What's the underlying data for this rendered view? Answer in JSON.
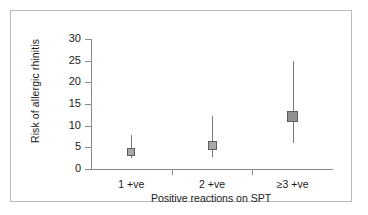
{
  "chart_data": {
    "type": "scatter",
    "title": "",
    "xlabel": "Positive reactions on SPT",
    "ylabel": "Risk of allergic rhinitis",
    "categories": [
      "1 +ve",
      "2 +ve",
      "≥3 +ve"
    ],
    "yticks": [
      0,
      5,
      10,
      15,
      20,
      25,
      30
    ],
    "ylim": [
      0,
      30
    ],
    "grid": false,
    "legend": null,
    "series": [
      {
        "name": "Risk of allergic rhinitis",
        "values": [
          4.0,
          5.5,
          12.2
        ],
        "error_low": [
          2.5,
          2.7,
          5.9
        ],
        "error_high": [
          7.8,
          12.3,
          25.0
        ]
      }
    ],
    "points": [
      {
        "category": "1 +ve",
        "value": 4.0,
        "ci_low": 2.5,
        "ci_high": 7.8
      },
      {
        "category": "2 +ve",
        "value": 5.5,
        "ci_low": 2.7,
        "ci_high": 12.3
      },
      {
        "category": "≥3 +ve",
        "value": 12.2,
        "ci_low": 5.9,
        "ci_high": 25.0
      }
    ]
  },
  "colors": {
    "marker_fill": "#a8a8a8",
    "marker_edge": "#5e5e5e",
    "whisker": "#777777",
    "axis": "#8b8b8b",
    "frame": "#b9b9b9",
    "text": "#1a1a1a",
    "background": "#ffffff"
  }
}
